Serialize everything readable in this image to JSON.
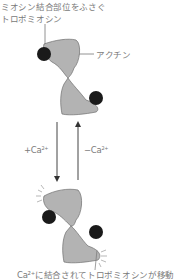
{
  "labels": {
    "top_line1": "ミオシン結合部位をふさぐ",
    "top_line2": "トロポミオシン",
    "actin": "アクチン",
    "add_ca": "+Ca",
    "remove_ca": "−Ca",
    "ca_superscript": "2+",
    "bottom": "Ca²⁺に結合されてトロポミオシンが移動"
  },
  "colors": {
    "actin_fill": "#b3b3b3",
    "actin_stroke": "#6e6e6e",
    "tropomyosin": "#1a1a1a",
    "arrow": "#444444",
    "text": "#7a7a7a"
  }
}
